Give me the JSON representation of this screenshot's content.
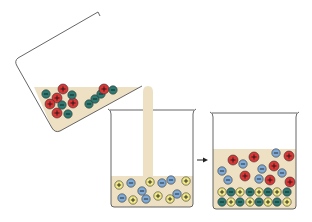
{
  "colors": {
    "liquid": "#ede0c3",
    "beaker_stroke": "#555555",
    "ion_red": "#d93636",
    "ion_teal": "#2c7a72",
    "ion_blue": "#7eaad8",
    "ion_yellow": "#f2ea86",
    "ion_outline": "#333333",
    "arrow": "#222222"
  },
  "ion_symbols": {
    "plus": "+",
    "minus": "−"
  },
  "beakers": {
    "tilted": {
      "label": "tilted pouring beaker",
      "ions": [
        {
          "x": 46,
          "y": 94,
          "type": "teal",
          "sign": "minus"
        },
        {
          "x": 63,
          "y": 89,
          "type": "red",
          "sign": "plus"
        },
        {
          "x": 57,
          "y": 98,
          "type": "red",
          "sign": "plus"
        },
        {
          "x": 50,
          "y": 104,
          "type": "red",
          "sign": "plus"
        },
        {
          "x": 62,
          "y": 105,
          "type": "teal",
          "sign": "minus"
        },
        {
          "x": 73,
          "y": 103,
          "type": "red",
          "sign": "plus"
        },
        {
          "x": 72,
          "y": 95,
          "type": "teal",
          "sign": "minus"
        },
        {
          "x": 57,
          "y": 113,
          "type": "red",
          "sign": "plus"
        },
        {
          "x": 68,
          "y": 114,
          "type": "teal",
          "sign": "minus"
        },
        {
          "x": 89,
          "y": 104,
          "type": "teal",
          "sign": "minus"
        },
        {
          "x": 95,
          "y": 99,
          "type": "teal",
          "sign": "minus"
        },
        {
          "x": 101,
          "y": 94,
          "type": "teal",
          "sign": "minus"
        },
        {
          "x": 104,
          "y": 89,
          "type": "red",
          "sign": "plus"
        },
        {
          "x": 113,
          "y": 90,
          "type": "teal",
          "sign": "minus"
        }
      ]
    },
    "middle": {
      "label": "receiving beaker",
      "ions": [
        {
          "x": 119,
          "y": 185,
          "type": "yellow",
          "sign": "plus"
        },
        {
          "x": 131,
          "y": 183,
          "type": "blue",
          "sign": "minus"
        },
        {
          "x": 150,
          "y": 182,
          "type": "yellow",
          "sign": "plus"
        },
        {
          "x": 162,
          "y": 183,
          "type": "blue",
          "sign": "minus"
        },
        {
          "x": 171,
          "y": 180,
          "type": "blue",
          "sign": "minus"
        },
        {
          "x": 186,
          "y": 181,
          "type": "yellow",
          "sign": "plus"
        },
        {
          "x": 142,
          "y": 191,
          "type": "blue",
          "sign": "minus"
        },
        {
          "x": 122,
          "y": 198,
          "type": "blue",
          "sign": "minus"
        },
        {
          "x": 133,
          "y": 200,
          "type": "yellow",
          "sign": "plus"
        },
        {
          "x": 146,
          "y": 199,
          "type": "blue",
          "sign": "minus"
        },
        {
          "x": 158,
          "y": 196,
          "type": "yellow",
          "sign": "plus"
        },
        {
          "x": 170,
          "y": 199,
          "type": "yellow",
          "sign": "plus"
        },
        {
          "x": 177,
          "y": 194,
          "type": "blue",
          "sign": "minus"
        },
        {
          "x": 186,
          "y": 197,
          "type": "yellow",
          "sign": "plus"
        }
      ]
    },
    "result": {
      "label": "result beaker with precipitate",
      "ions": [
        {
          "x": 233,
          "y": 160,
          "type": "red",
          "sign": "plus"
        },
        {
          "x": 243,
          "y": 164,
          "type": "blue",
          "sign": "minus"
        },
        {
          "x": 254,
          "y": 157,
          "type": "red",
          "sign": "plus"
        },
        {
          "x": 276,
          "y": 153,
          "type": "blue",
          "sign": "minus"
        },
        {
          "x": 289,
          "y": 156,
          "type": "red",
          "sign": "plus"
        },
        {
          "x": 222,
          "y": 171,
          "type": "blue",
          "sign": "minus"
        },
        {
          "x": 228,
          "y": 180,
          "type": "blue",
          "sign": "minus"
        },
        {
          "x": 245,
          "y": 176,
          "type": "red",
          "sign": "plus"
        },
        {
          "x": 262,
          "y": 169,
          "type": "blue",
          "sign": "minus"
        },
        {
          "x": 274,
          "y": 166,
          "type": "red",
          "sign": "plus"
        },
        {
          "x": 282,
          "y": 173,
          "type": "blue",
          "sign": "minus"
        },
        {
          "x": 259,
          "y": 179,
          "type": "blue",
          "sign": "minus"
        },
        {
          "x": 270,
          "y": 180,
          "type": "red",
          "sign": "plus"
        },
        {
          "x": 290,
          "y": 182,
          "type": "red",
          "sign": "plus"
        },
        {
          "x": 222,
          "y": 192,
          "type": "yellow",
          "sign": "plus"
        },
        {
          "x": 231,
          "y": 192,
          "type": "teal",
          "sign": "minus"
        },
        {
          "x": 240,
          "y": 192,
          "type": "yellow",
          "sign": "plus"
        },
        {
          "x": 250,
          "y": 192,
          "type": "teal",
          "sign": "minus"
        },
        {
          "x": 259,
          "y": 192,
          "type": "yellow",
          "sign": "plus"
        },
        {
          "x": 268,
          "y": 192,
          "type": "teal",
          "sign": "minus"
        },
        {
          "x": 277,
          "y": 192,
          "type": "yellow",
          "sign": "plus"
        },
        {
          "x": 287,
          "y": 192,
          "type": "teal",
          "sign": "minus"
        },
        {
          "x": 222,
          "y": 202,
          "type": "teal",
          "sign": "minus"
        },
        {
          "x": 231,
          "y": 202,
          "type": "yellow",
          "sign": "plus"
        },
        {
          "x": 240,
          "y": 202,
          "type": "teal",
          "sign": "minus"
        },
        {
          "x": 250,
          "y": 202,
          "type": "yellow",
          "sign": "plus"
        },
        {
          "x": 259,
          "y": 202,
          "type": "teal",
          "sign": "minus"
        },
        {
          "x": 268,
          "y": 202,
          "type": "yellow",
          "sign": "plus"
        },
        {
          "x": 277,
          "y": 202,
          "type": "teal",
          "sign": "minus"
        },
        {
          "x": 287,
          "y": 202,
          "type": "yellow",
          "sign": "plus"
        }
      ]
    }
  },
  "arrow": {
    "label": "reaction arrow"
  }
}
